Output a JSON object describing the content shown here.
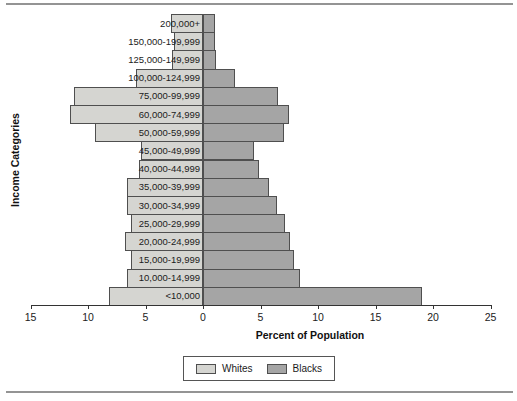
{
  "figure": {
    "x_axis_title": "Percent of Population",
    "y_axis_title": "Income Categories"
  },
  "legend": {
    "items": [
      {
        "label": "Whites",
        "color": "#d5d5d1"
      },
      {
        "label": "Blacks",
        "color": "#a5a5a5"
      }
    ]
  },
  "chart_data": {
    "type": "bar",
    "subtype": "population-pyramid",
    "orientation": "horizontal",
    "title": "",
    "xlabel": "Percent of Population",
    "ylabel": "Income Categories",
    "xlim": [
      -15,
      25
    ],
    "x_tick_values": [
      -15,
      -10,
      -5,
      0,
      5,
      10,
      15,
      20,
      25
    ],
    "x_tick_labels": [
      "15",
      "10",
      "5",
      "0",
      "5",
      "10",
      "15",
      "20",
      "25"
    ],
    "legend_position": "bottom",
    "grid": false,
    "categories": [
      "200,000+",
      "150,000-199,999",
      "125,000-149,999",
      "100,000-124,999",
      "75,000-99,999",
      "60,000-74,999",
      "50,000-59,999",
      "45,000-49,999",
      "40,000-44,999",
      "35,000-39,999",
      "30,000-34,999",
      "25,000-29,999",
      "20,000-24,999",
      "15,000-19,999",
      "10,000-14,999",
      "<10,000"
    ],
    "series": [
      {
        "name": "Whites",
        "side": "left",
        "color": "#d5d5d1",
        "values": [
          2.8,
          2.5,
          2.7,
          5.8,
          11.2,
          11.6,
          9.4,
          5.4,
          5.6,
          6.6,
          6.6,
          6.3,
          6.8,
          6.3,
          6.6,
          8.2
        ]
      },
      {
        "name": "Blacks",
        "side": "right",
        "color": "#a5a5a5",
        "values": [
          1.0,
          1.0,
          1.1,
          2.8,
          6.5,
          7.5,
          7.0,
          4.4,
          4.9,
          5.7,
          6.4,
          7.1,
          7.6,
          7.9,
          8.4,
          19.0
        ]
      }
    ]
  }
}
